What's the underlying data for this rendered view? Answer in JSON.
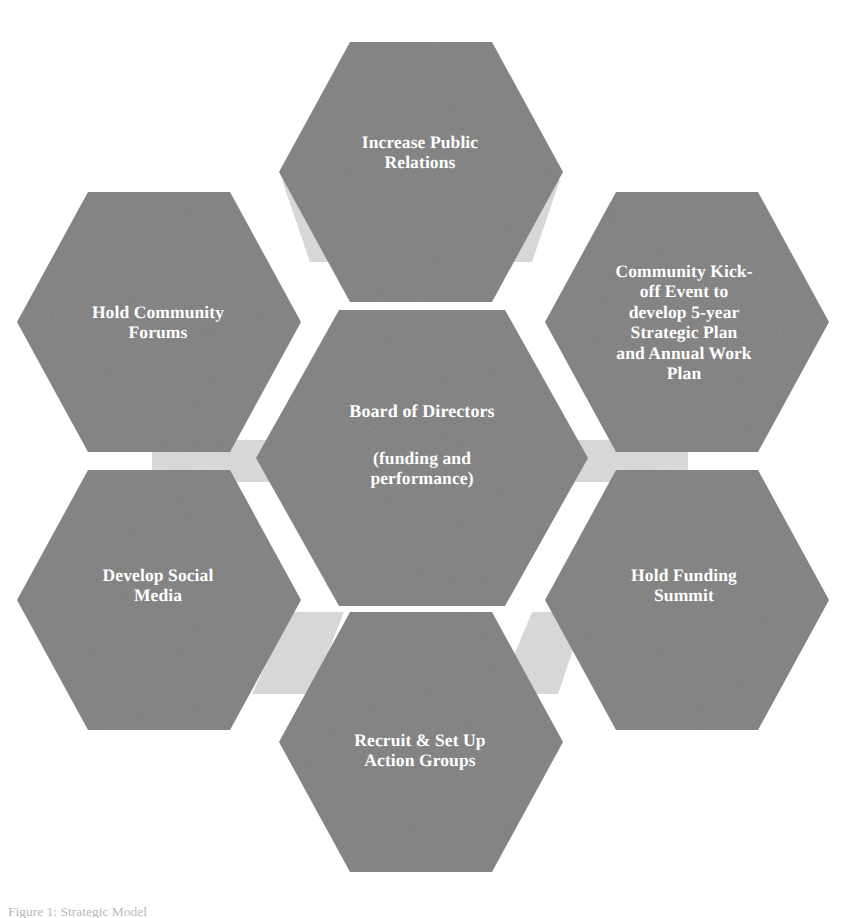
{
  "diagram": {
    "type": "hexagon-hub-and-spoke",
    "colors": {
      "hexagon_fill": "#7f7f7f",
      "connector_fill": "#d9d9d9",
      "label_text": "#ffffff",
      "background": "#ffffff"
    },
    "center": {
      "id": "board-of-directors",
      "main_label": "Board of Directors",
      "sub_label": "(funding and\nperformance)"
    },
    "satellites": [
      {
        "id": "increase-public-relations",
        "position": "top",
        "label": "Increase Public\nRelations"
      },
      {
        "id": "community-kickoff-event",
        "position": "upper-right",
        "label": "Community Kick-\noff Event to\ndevelop 5-year\nStrategic Plan\nand Annual Work\nPlan"
      },
      {
        "id": "hold-funding-summit",
        "position": "lower-right",
        "label": "Hold Funding\nSummit"
      },
      {
        "id": "recruit-set-up-action-groups",
        "position": "bottom",
        "label": "Recruit & Set Up\nAction Groups"
      },
      {
        "id": "develop-social-media",
        "position": "lower-left",
        "label": "Develop Social\nMedia"
      },
      {
        "id": "hold-community-forums",
        "position": "upper-left",
        "label": "Hold Community\nForums"
      }
    ],
    "caption_remnant": "Figure 1: Strategic Model"
  }
}
